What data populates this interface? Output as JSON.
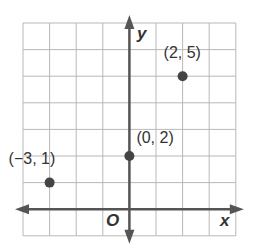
{
  "chart_data": {
    "type": "scatter",
    "title": "",
    "xlabel": "x",
    "ylabel": "y",
    "origin_label": "O",
    "xlim": [
      -4,
      4
    ],
    "ylim": [
      -1,
      7
    ],
    "grid": true,
    "points": [
      {
        "x": -3,
        "y": 1,
        "label": "(−3, 1)"
      },
      {
        "x": 0,
        "y": 2,
        "label": "(0, 2)"
      },
      {
        "x": 2,
        "y": 5,
        "label": "(2, 5)"
      }
    ],
    "colors": {
      "grid": "#b8b8b8",
      "axis": "#555555",
      "point": "#444444",
      "text": "#333333"
    }
  }
}
